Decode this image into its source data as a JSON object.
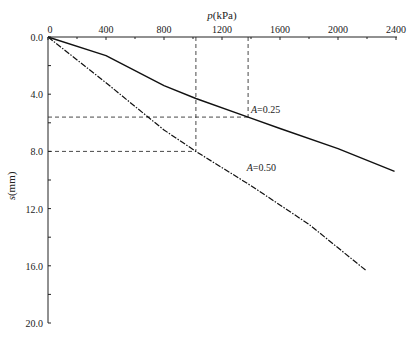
{
  "chart_data": {
    "type": "line",
    "title": "",
    "xlabel": "p(kPa)",
    "xlabel_italic": "p",
    "xlabel_unit": "(kPa)",
    "ylabel": "s(mm)",
    "ylabel_italic": "s",
    "ylabel_unit": "(mm)",
    "xlim": [
      0,
      2400
    ],
    "ylim": [
      0,
      20
    ],
    "y_inverted": true,
    "x_axis_position": "top",
    "grid": false,
    "x_ticks": [
      0,
      400,
      800,
      1200,
      1600,
      2000,
      2400
    ],
    "x_tick_labels": [
      "0",
      "400",
      "800",
      "1200",
      "1600",
      "2000",
      "2400"
    ],
    "y_ticks": [
      0,
      4,
      8,
      12,
      16,
      20
    ],
    "y_tick_labels": [
      "0.0",
      "4.0",
      "8.0",
      "12.0",
      "16.0",
      "20.0"
    ],
    "series": [
      {
        "name": "A=0.25",
        "style": "solid",
        "x": [
          0,
          400,
          800,
          1020,
          1380,
          1600,
          2000,
          2390
        ],
        "y": [
          0,
          1.3,
          3.4,
          4.3,
          5.6,
          6.4,
          7.8,
          9.4
        ]
      },
      {
        "name": "A=0.50",
        "style": "dash-dot",
        "x": [
          0,
          400,
          690,
          800,
          1020,
          1400,
          1800,
          2190
        ],
        "y": [
          0,
          3.2,
          5.6,
          6.5,
          8.0,
          10.4,
          13.1,
          16.3
        ]
      }
    ],
    "annotations": [
      {
        "text": "A=0.25",
        "x": 1400,
        "y": 5.3
      },
      {
        "text": "A=0.50",
        "x": 1370,
        "y": 9.4
      }
    ],
    "reference_lines": [
      {
        "type": "vertical",
        "x": 1020,
        "y_from": 0,
        "y_to": 8.0,
        "style": "dashed"
      },
      {
        "type": "vertical",
        "x": 1380,
        "y_from": 0,
        "y_to": 5.6,
        "style": "dashed"
      },
      {
        "type": "horizontal",
        "y": 5.6,
        "x_from": 0,
        "x_to": 1380,
        "style": "dashed"
      },
      {
        "type": "horizontal",
        "y": 8.0,
        "x_from": 0,
        "x_to": 1020,
        "style": "dashed"
      }
    ]
  }
}
